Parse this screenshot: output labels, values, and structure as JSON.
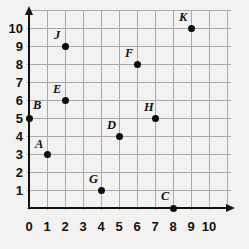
{
  "chart_data": {
    "type": "scatter",
    "title": "",
    "xlabel": "",
    "ylabel": "",
    "xlim": [
      0,
      10
    ],
    "ylim": [
      0,
      10
    ],
    "grid": true,
    "legend": "none",
    "x_ticks": [
      "0",
      "1",
      "2",
      "3",
      "4",
      "5",
      "6",
      "7",
      "8",
      "9",
      "10"
    ],
    "y_ticks": [
      "1",
      "2",
      "3",
      "4",
      "5",
      "6",
      "7",
      "8",
      "9",
      "10"
    ],
    "points": [
      {
        "label": "A",
        "x": 1,
        "y": 3,
        "label_dx": -12,
        "label_dy": -16
      },
      {
        "label": "B",
        "x": 0,
        "y": 5,
        "label_dx": 4,
        "label_dy": -19
      },
      {
        "label": "C",
        "x": 8,
        "y": 0,
        "label_dx": -12,
        "label_dy": -18
      },
      {
        "label": "D",
        "x": 5,
        "y": 4,
        "label_dx": -12,
        "label_dy": -17
      },
      {
        "label": "E",
        "x": 2,
        "y": 6,
        "label_dx": -12,
        "label_dy": -17
      },
      {
        "label": "F",
        "x": 6,
        "y": 8,
        "label_dx": -12,
        "label_dy": -17
      },
      {
        "label": "G",
        "x": 4,
        "y": 1,
        "label_dx": -12,
        "label_dy": -17
      },
      {
        "label": "H",
        "x": 7,
        "y": 5,
        "label_dx": -11,
        "label_dy": -17
      },
      {
        "label": "J",
        "x": 2,
        "y": 9,
        "label_dx": -11,
        "label_dy": -17
      },
      {
        "label": "K",
        "x": 9,
        "y": 10,
        "label_dx": -12,
        "label_dy": -17
      }
    ]
  },
  "axes": {
    "origin_label": "0",
    "x_axis_name": "x-axis",
    "y_axis_name": "y-axis"
  }
}
